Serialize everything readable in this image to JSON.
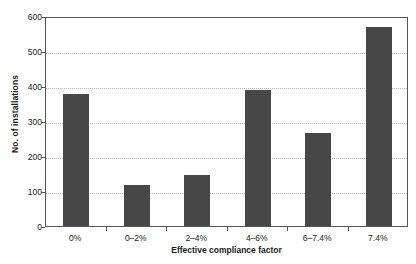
{
  "chart_data": {
    "type": "bar",
    "title": "",
    "xlabel": "Effective compliance factor",
    "ylabel": "No. of installations",
    "categories": [
      "0%",
      "0–2%",
      "2–4%",
      "4–6%",
      "6–7.4%",
      "7.4%"
    ],
    "values": [
      376,
      117,
      147,
      390,
      266,
      569
    ],
    "ylim": [
      0,
      600
    ],
    "yticks": [
      0,
      100,
      200,
      300,
      400,
      500,
      600
    ],
    "ytick_labels": [
      "0",
      "100",
      "200",
      "300",
      "400",
      "500",
      "600"
    ],
    "grid": true,
    "grid_style": "dotted",
    "legend": null,
    "bar_color": "#474747",
    "axis_color": "#555555",
    "grid_color": "#b4b4b4",
    "background": "#ffffff"
  }
}
